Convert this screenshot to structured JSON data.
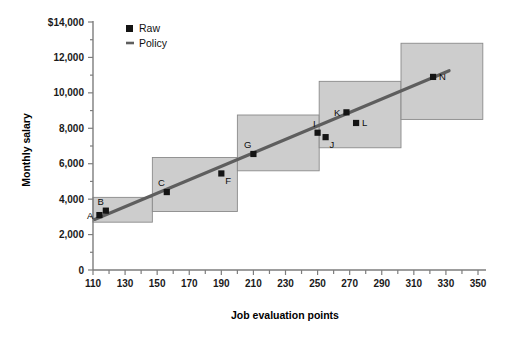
{
  "chart_data": {
    "type": "scatter",
    "title": "",
    "xlabel": "Job evaluation points",
    "ylabel": "Monthly salary",
    "xlim": [
      110,
      350
    ],
    "ylim": [
      0,
      14000
    ],
    "grid": false,
    "legend_position": "top-left-inside",
    "x_ticks": [
      110,
      130,
      150,
      170,
      190,
      210,
      230,
      250,
      270,
      290,
      310,
      330,
      350
    ],
    "x_tick_labels": [
      "110",
      "130",
      "150",
      "170",
      "190",
      "210",
      "230",
      "250",
      "270",
      "290",
      "310",
      "330",
      "350"
    ],
    "x_minor_step": 10,
    "y_ticks": [
      0,
      2000,
      4000,
      6000,
      8000,
      10000,
      12000,
      14000
    ],
    "y_tick_labels": [
      "0",
      "2,000",
      "4,000",
      "6,000",
      "8,000",
      "10,000",
      "12,000",
      "$14,000"
    ],
    "y_minor_step": 1000,
    "legend": [
      {
        "name": "Raw",
        "marker": "square",
        "color": "#141414"
      },
      {
        "name": "Policy",
        "marker": "line",
        "color": "#5e5e5e"
      }
    ],
    "series": [
      {
        "name": "Raw",
        "type": "scatter",
        "points": [
          {
            "label": "A",
            "x": 114,
            "y": 3100,
            "label_pos": "left"
          },
          {
            "label": "B",
            "x": 118,
            "y": 3350,
            "label_pos": "above-left"
          },
          {
            "label": "C",
            "x": 156,
            "y": 4400,
            "label_pos": "above-left"
          },
          {
            "label": "F",
            "x": 190,
            "y": 5450,
            "label_pos": "below-right"
          },
          {
            "label": "G",
            "x": 210,
            "y": 6550,
            "label_pos": "above-left"
          },
          {
            "label": "I",
            "x": 250,
            "y": 7750,
            "label_pos": "above-left"
          },
          {
            "label": "J",
            "x": 255,
            "y": 7500,
            "label_pos": "below-right"
          },
          {
            "label": "K",
            "x": 268,
            "y": 8900,
            "label_pos": "left"
          },
          {
            "label": "L",
            "x": 274,
            "y": 8300,
            "label_pos": "right"
          },
          {
            "label": "N",
            "x": 322,
            "y": 10900,
            "label_pos": "right"
          }
        ]
      },
      {
        "name": "Policy",
        "type": "line",
        "x": [
          111,
          332
        ],
        "y": [
          2850,
          11250
        ]
      }
    ],
    "grade_boxes": [
      {
        "x0": 110,
        "x1": 147,
        "y0": 2700,
        "y1": 4100
      },
      {
        "x0": 147,
        "x1": 200,
        "y0": 3300,
        "y1": 6350
      },
      {
        "x0": 200,
        "x1": 251,
        "y0": 5600,
        "y1": 8750
      },
      {
        "x0": 251,
        "x1": 302,
        "y0": 6900,
        "y1": 10650
      },
      {
        "x0": 302,
        "x1": 353,
        "y0": 8500,
        "y1": 12800
      }
    ]
  },
  "axes": {
    "y_title": "Monthly salary",
    "x_title": "Job evaluation points"
  },
  "legend": {
    "raw_label": "Raw",
    "policy_label": "Policy"
  }
}
